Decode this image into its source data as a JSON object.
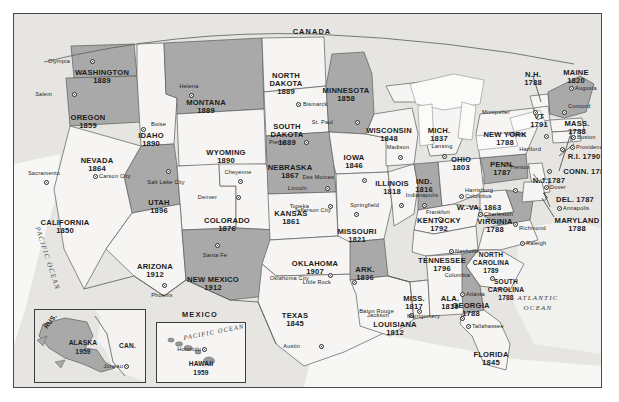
{
  "map": {
    "title": "United States statehood map",
    "countries": [
      {
        "name": "CANADA",
        "x": 298,
        "y": 20
      },
      {
        "name": "MEXICO",
        "x": 186,
        "y": 297
      }
    ],
    "oceans": [
      {
        "name": "PACIFIC OCEAN",
        "x": 30,
        "y": 226,
        "rot": "pac"
      },
      {
        "name": "ATLANTIC OCEAN_1",
        "label": "ATLANTIC",
        "x": 524,
        "y": 283
      },
      {
        "name": "ATLANTIC OCEAN_2",
        "label": "OCEAN",
        "x": 524,
        "y": 292
      }
    ],
    "states": [
      {
        "name": "WASHINGTON",
        "year": "1889",
        "x": 88,
        "y": 55,
        "shaded": true
      },
      {
        "name": "OREGON",
        "year": "1859",
        "x": 74,
        "y": 100,
        "shaded": true
      },
      {
        "name": "IDAHO",
        "year": "1890",
        "x": 137,
        "y": 118,
        "shaded": false
      },
      {
        "name": "MONTANA",
        "year": "1889",
        "x": 192,
        "y": 85,
        "shaded": true
      },
      {
        "name": "WYOMING",
        "year": "1890",
        "x": 212,
        "y": 135,
        "shaded": false
      },
      {
        "name": "NEVADA",
        "year": "1864",
        "x": 83,
        "y": 143,
        "shaded": true
      },
      {
        "name": "UTAH",
        "year": "1896",
        "x": 145,
        "y": 185,
        "shaded": false
      },
      {
        "name": "CALIFORNIA",
        "year": "1850",
        "x": 51,
        "y": 205,
        "shaded": false
      },
      {
        "name": "COLORADO",
        "year": "1876",
        "x": 213,
        "y": 203,
        "shaded": false
      },
      {
        "name": "ARIZONA",
        "year": "1912",
        "x": 141,
        "y": 249,
        "shaded": false
      },
      {
        "name": "NEW MEXICO",
        "year": "1912",
        "x": 199,
        "y": 262,
        "shaded": true
      },
      {
        "name": "NORTH DAKOTA",
        "year": "1889",
        "x": 272,
        "y": 58,
        "shaded": false
      },
      {
        "name": "SOUTH DAKOTA",
        "year": "1889",
        "x": 273,
        "y": 109,
        "shaded": false
      },
      {
        "name": "NEBRASKA",
        "year": "1867",
        "x": 276,
        "y": 150,
        "shaded": true
      },
      {
        "name": "KANSAS",
        "year": "1861",
        "x": 277,
        "y": 196,
        "shaded": false
      },
      {
        "name": "OKLAHOMA",
        "year": "1907",
        "x": 301,
        "y": 246,
        "shaded": false
      },
      {
        "name": "TEXAS",
        "year": "1845",
        "x": 281,
        "y": 298,
        "shaded": false
      },
      {
        "name": "MINNESOTA",
        "year": "1858",
        "x": 332,
        "y": 73,
        "shaded": true
      },
      {
        "name": "IOWA",
        "year": "1846",
        "x": 340,
        "y": 140,
        "shaded": false
      },
      {
        "name": "MISSOURI",
        "year": "1821",
        "x": 343,
        "y": 214,
        "shaded": false
      },
      {
        "name": "ARKANSAS",
        "label": "ARK.",
        "year": "1836",
        "x": 351,
        "y": 252,
        "shaded": true
      },
      {
        "name": "LOUISIANA",
        "year": "1812",
        "x": 381,
        "y": 307,
        "shaded": false
      },
      {
        "name": "WISCONSIN",
        "year": "1848",
        "x": 375,
        "y": 113,
        "shaded": false
      },
      {
        "name": "ILLINOIS",
        "year": "1818",
        "x": 378,
        "y": 166,
        "shaded": false
      },
      {
        "name": "MISSISSIPPI",
        "label": "MISS.",
        "year": "1817",
        "x": 400,
        "y": 281,
        "shaded": false
      },
      {
        "name": "MICHIGAN",
        "label": "MICH.",
        "year": "1837",
        "x": 425,
        "y": 113,
        "shaded": false
      },
      {
        "name": "INDIANA",
        "label": "IND.",
        "year": "1816",
        "x": 410,
        "y": 164,
        "shaded": true
      },
      {
        "name": "KENTUCKY",
        "year": "1792",
        "x": 425,
        "y": 203,
        "shaded": false
      },
      {
        "name": "TENNESSEE",
        "year": "1796",
        "x": 428,
        "y": 243,
        "shaded": false
      },
      {
        "name": "ALABAMA",
        "label": "ALA.",
        "year": "1819",
        "x": 436,
        "y": 281,
        "shaded": false
      },
      {
        "name": "OHIO",
        "year": "1803",
        "x": 447,
        "y": 142,
        "shaded": false
      },
      {
        "name": "WEST VIRGINIA",
        "label": "W.-VA. 1863",
        "year": "",
        "x": 465,
        "y": 190,
        "shaded": false
      },
      {
        "name": "VIRGINIA",
        "year": "1788",
        "x": 481,
        "y": 204,
        "shaded": true
      },
      {
        "name": "NORTH CAROLINA",
        "year": "1789",
        "x": 477,
        "y": 238,
        "shaded": false
      },
      {
        "name": "SOUTH CAROLINA",
        "year": "1788",
        "x": 492,
        "y": 265,
        "shaded": false
      },
      {
        "name": "GEORGIA",
        "year": "1788",
        "x": 457,
        "y": 288,
        "shaded": true
      },
      {
        "name": "FLORIDA",
        "year": "1845",
        "x": 477,
        "y": 337,
        "shaded": false
      },
      {
        "name": "PENNSYLVANIA",
        "label": "PENN.",
        "year": "1787",
        "x": 488,
        "y": 147,
        "shaded": true
      },
      {
        "name": "NEW YORK",
        "year": "1788",
        "x": 491,
        "y": 117,
        "shaded": false
      },
      {
        "name": "VERMONT",
        "label": "VT",
        "year": "1791",
        "x": 525,
        "y": 99,
        "shaded": false
      },
      {
        "name": "NEW HAMPSHIRE",
        "label": "N.H.",
        "year": "1788",
        "x": 519,
        "y": 57,
        "shaded": false
      },
      {
        "name": "MAINE",
        "year": "1820",
        "x": 562,
        "y": 55,
        "shaded": true
      },
      {
        "name": "MASSACHUSETTS",
        "label": "MASS.",
        "year": "1788",
        "x": 563,
        "y": 106,
        "shaded": false
      },
      {
        "name": "RHODE ISLAND",
        "label": "R.I. 1790",
        "year": "",
        "x": 570,
        "y": 139,
        "shaded": false
      },
      {
        "name": "CONNECTICUT",
        "label": "CONN. 1788",
        "year": "",
        "x": 572,
        "y": 154,
        "shaded": false
      },
      {
        "name": "NEW JERSEY",
        "label": "N.J.1787",
        "year": "",
        "x": 535,
        "y": 163,
        "shaded": false
      },
      {
        "name": "DELAWARE",
        "label": "DEL. 1787",
        "year": "",
        "x": 561,
        "y": 182,
        "shaded": false
      },
      {
        "name": "MARYLAND",
        "year": "1788",
        "x": 563,
        "y": 203,
        "shaded": false
      }
    ],
    "cities": [
      {
        "name": "Olympia",
        "x": 56,
        "y": 45,
        "dotx": 76,
        "doty": 45,
        "align": "right"
      },
      {
        "name": "Salem",
        "x": 38,
        "y": 78,
        "dotx": 58,
        "doty": 78,
        "align": "right"
      },
      {
        "name": "Helena",
        "x": 175,
        "y": 70,
        "dotx": 175,
        "doty": 79,
        "align": "center"
      },
      {
        "name": "Boise",
        "x": 137,
        "y": 108,
        "dotx": 127,
        "doty": 113,
        "align": "left"
      },
      {
        "name": "Carson City",
        "x": 85,
        "y": 160,
        "dotx": 79,
        "doty": 160,
        "align": "left"
      },
      {
        "name": "Sacramento",
        "x": 30,
        "y": 157,
        "dotx": 30,
        "doty": 166,
        "align": "center"
      },
      {
        "name": "Salt Lake City",
        "x": 152,
        "y": 166,
        "dotx": 152,
        "doty": 155,
        "align": "center"
      },
      {
        "name": "Cheyenne",
        "x": 224,
        "y": 156,
        "dotx": 224,
        "doty": 165,
        "align": "center"
      },
      {
        "name": "Denver",
        "x": 203,
        "y": 181,
        "dotx": 222,
        "doty": 181,
        "align": "right"
      },
      {
        "name": "Santa Fe",
        "x": 201,
        "y": 239,
        "dotx": 201,
        "doty": 229,
        "align": "center"
      },
      {
        "name": "Phoenix",
        "x": 148,
        "y": 279,
        "dotx": 148,
        "doty": 269,
        "align": "center"
      },
      {
        "name": "Bismarck",
        "x": 289,
        "y": 88,
        "dotx": 282,
        "doty": 88,
        "align": "left"
      },
      {
        "name": "Pierre",
        "x": 271,
        "y": 126,
        "dotx": 290,
        "doty": 126,
        "align": "right"
      },
      {
        "name": "Lincoln",
        "x": 293,
        "y": 172,
        "dotx": 311,
        "doty": 172,
        "align": "right"
      },
      {
        "name": "Topeka",
        "x": 295,
        "y": 190,
        "dotx": 314,
        "doty": 190,
        "align": "right"
      },
      {
        "name": "Oklahoma City",
        "x": 295,
        "y": 262,
        "dotx": 314,
        "doty": 259,
        "align": "right"
      },
      {
        "name": "Austin",
        "x": 286,
        "y": 330,
        "dotx": 305,
        "doty": 330,
        "align": "right"
      },
      {
        "name": "St. Paul",
        "x": 319,
        "y": 106,
        "dotx": 341,
        "doty": 106,
        "align": "right"
      },
      {
        "name": "Des Moines",
        "x": 320,
        "y": 161,
        "dotx": 348,
        "doty": 164,
        "align": "right"
      },
      {
        "name": "Jefferson City",
        "x": 317,
        "y": 194,
        "dotx": 340,
        "doty": 198,
        "align": "right"
      },
      {
        "name": "Springfield",
        "x": 365,
        "y": 189,
        "dotx": 385,
        "doty": 189,
        "align": "right"
      },
      {
        "name": "Little Rock",
        "x": 317,
        "y": 266,
        "dotx": 338,
        "doty": 266,
        "align": "right"
      },
      {
        "name": "Jackson",
        "x": 375,
        "y": 299,
        "dotx": 395,
        "doty": 299,
        "align": "right"
      },
      {
        "name": "Baton Rouge",
        "x": 380,
        "y": 295,
        "dotx": 403,
        "doty": 295,
        "align": "right"
      },
      {
        "name": "Madison",
        "x": 384,
        "y": 131,
        "dotx": 384,
        "doty": 141,
        "align": "center"
      },
      {
        "name": "Lansing",
        "x": 428,
        "y": 130,
        "dotx": 428,
        "doty": 140,
        "align": "center"
      },
      {
        "name": "Indianapolis",
        "x": 408,
        "y": 179,
        "dotx": 408,
        "doty": 189,
        "align": "center"
      },
      {
        "name": "Columbus",
        "x": 451,
        "y": 180,
        "dotx": 445,
        "doty": 180,
        "align": "left"
      },
      {
        "name": "Frankfort",
        "x": 424,
        "y": 196,
        "dotx": 424,
        "doty": 203,
        "align": "center"
      },
      {
        "name": "Charleston",
        "x": 470,
        "y": 198,
        "dotx": 464,
        "doty": 198,
        "align": "left"
      },
      {
        "name": "Richmond",
        "x": 505,
        "y": 212,
        "dotx": 499,
        "doty": 208,
        "align": "left"
      },
      {
        "name": "Raleigh",
        "x": 512,
        "y": 227,
        "dotx": 506,
        "doty": 227,
        "align": "left"
      },
      {
        "name": "Columbia",
        "x": 456,
        "y": 259,
        "dotx": 476,
        "doty": 262,
        "align": "right"
      },
      {
        "name": "Nashville",
        "x": 441,
        "y": 235,
        "dotx": 435,
        "doty": 235,
        "align": "left"
      },
      {
        "name": "Montgomery",
        "x": 426,
        "y": 300,
        "dotx": 446,
        "doty": 302,
        "align": "right"
      },
      {
        "name": "Atlanta",
        "x": 452,
        "y": 278,
        "dotx": 446,
        "doty": 278,
        "align": "left"
      },
      {
        "name": "Tallahassee",
        "x": 458,
        "y": 310,
        "dotx": 452,
        "doty": 310,
        "align": "left"
      },
      {
        "name": "Harrisburg",
        "x": 479,
        "y": 174,
        "dotx": 499,
        "doty": 174,
        "align": "right"
      },
      {
        "name": "Trenton",
        "x": 516,
        "y": 151,
        "dotx": 533,
        "doty": 155,
        "align": "right"
      },
      {
        "name": "Dover",
        "x": 536,
        "y": 171,
        "dotx": 530,
        "doty": 171,
        "align": "left"
      },
      {
        "name": "Annapolis",
        "x": 549,
        "y": 192,
        "dotx": 543,
        "doty": 192,
        "align": "left"
      },
      {
        "name": "Albany",
        "x": 512,
        "y": 118,
        "dotx": 530,
        "doty": 120,
        "align": "right"
      },
      {
        "name": "Hartford",
        "x": 527,
        "y": 133,
        "dotx": 546,
        "doty": 133,
        "align": "right"
      },
      {
        "name": "Providence",
        "x": 562,
        "y": 131,
        "dotx": 556,
        "doty": 131,
        "align": "left"
      },
      {
        "name": "Boston",
        "x": 563,
        "y": 121,
        "dotx": 557,
        "doty": 121,
        "align": "left"
      },
      {
        "name": "Concord",
        "x": 554,
        "y": 90,
        "dotx": 548,
        "doty": 96,
        "align": "left"
      },
      {
        "name": "Augusta",
        "x": 561,
        "y": 72,
        "dotx": 555,
        "doty": 72,
        "align": "left"
      },
      {
        "name": "Montpelier",
        "x": 496,
        "y": 96,
        "dotx": 519,
        "doty": 96,
        "align": "right"
      }
    ],
    "insets": {
      "alaska": {
        "state": "ALASKA",
        "year": "1959",
        "neighbor_russia": "RUS.",
        "neighbor_canada": "CAN.",
        "city": "Juneau"
      },
      "hawaii": {
        "state": "HAWAII",
        "year": "1959",
        "ocean": "PACIFIC OCEAN",
        "city": "Honolulu"
      }
    },
    "colors": {
      "shaded_state": "#a9a9a9",
      "plain_state": "#f6f5f3",
      "water": "#efeeec",
      "border": "#4a4a4a",
      "text": "#1b1b1b"
    }
  }
}
